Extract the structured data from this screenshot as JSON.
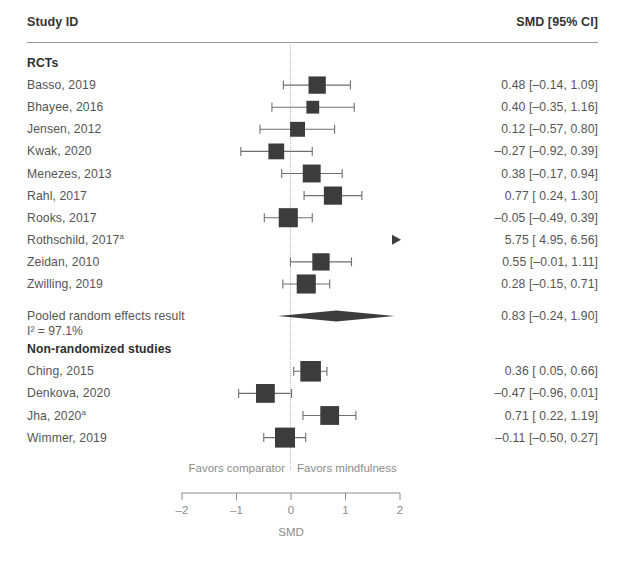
{
  "header": {
    "study_column": "Study ID",
    "estimate_column": "SMD [95% CI]"
  },
  "groups": [
    {
      "label": "RCTs"
    },
    {
      "label": "Non-randomized studies"
    }
  ],
  "pooled": {
    "label": "Pooled random effects result",
    "heterogeneity": "I² = 97.1%",
    "estimate_text": "0.83 [–0.24, 1.90]"
  },
  "footnote_marker": "a",
  "axis": {
    "title": "SMD",
    "left_hint": "Favors comparator",
    "right_hint": "Favors mindfulness",
    "tick_labels": [
      "–2",
      "–1",
      "0",
      "1",
      "2"
    ],
    "tick_values": [
      -2,
      -1,
      0,
      1,
      2
    ],
    "min": -2,
    "max": 2
  },
  "rows": [
    {
      "study": "Basso, 2019",
      "estimate_text": "0.48 [–0.14, 1.09]"
    },
    {
      "study": "Bhayee, 2016",
      "estimate_text": "0.40 [–0.35, 1.16]"
    },
    {
      "study": "Jensen, 2012",
      "estimate_text": "0.12 [–0.57, 0.80]"
    },
    {
      "study": "Kwak, 2020",
      "estimate_text": "–0.27 [–0.92, 0.39]"
    },
    {
      "study": "Menezes, 2013",
      "estimate_text": "0.38 [–0.17, 0.94]"
    },
    {
      "study": "Rahl, 2017",
      "estimate_text": "0.77 [ 0.24, 1.30]"
    },
    {
      "study": "Rooks, 2017",
      "estimate_text": "–0.05 [–0.49, 0.39]"
    },
    {
      "study": "Rothschild, 2017",
      "estimate_text": "5.75 [ 4.95, 6.56]",
      "superscript": "a"
    },
    {
      "study": "Zeidan, 2010",
      "estimate_text": "0.55 [–0.01, 1.11]"
    },
    {
      "study": "Zwilling, 2019",
      "estimate_text": "0.28 [–0.15, 0.71]"
    },
    {
      "study": "Ching, 2015",
      "estimate_text": "0.36 [ 0.05, 0.66]"
    },
    {
      "study": "Denkova, 2020",
      "estimate_text": "–0.47 [–0.96, 0.01]"
    },
    {
      "study": "Jha, 2020",
      "estimate_text": "0.71 [ 0.22, 1.19]",
      "superscript": "a"
    },
    {
      "study": "Wimmer, 2019",
      "estimate_text": "–0.11 [–0.50, 0.27]"
    }
  ],
  "colors": {
    "marker": "#3c3c3c",
    "line": "#6f6f6f",
    "text": "#555555",
    "rule": "#9a9a9a",
    "zero_line": "#b9b9b9",
    "axis_text": "#8c8c8c"
  },
  "chart_data": {
    "type": "forest",
    "title": "",
    "xlabel": "SMD",
    "ylabel": "",
    "xlim": [
      -2,
      2
    ],
    "xticks": [
      -2,
      -1,
      0,
      1,
      2
    ],
    "grid": false,
    "reference_line": 0,
    "effect_measure": "SMD",
    "ci_level": "95%",
    "left_hint": "Favors comparator",
    "right_hint": "Favors mindfulness",
    "subgroups": [
      {
        "name": "RCTs",
        "studies": [
          {
            "label": "Basso, 2019",
            "est": 0.48,
            "lo": -0.14,
            "hi": 1.09,
            "weight": 0.62
          },
          {
            "label": "Bhayee, 2016",
            "est": 0.4,
            "lo": -0.35,
            "hi": 1.16,
            "weight": 0.32
          },
          {
            "label": "Jensen, 2012",
            "est": 0.12,
            "lo": -0.57,
            "hi": 0.8,
            "weight": 0.46
          },
          {
            "label": "Kwak, 2020",
            "est": -0.27,
            "lo": -0.92,
            "hi": 0.39,
            "weight": 0.52
          },
          {
            "label": "Menezes, 2013",
            "est": 0.38,
            "lo": -0.17,
            "hi": 0.94,
            "weight": 0.66
          },
          {
            "label": "Rahl, 2017",
            "est": 0.77,
            "lo": 0.24,
            "hi": 1.3,
            "weight": 0.68
          },
          {
            "label": "Rooks, 2017",
            "est": -0.05,
            "lo": -0.49,
            "hi": 0.39,
            "weight": 0.74
          },
          {
            "label": "Rothschild, 2017",
            "est": 5.75,
            "lo": 4.95,
            "hi": 6.56,
            "weight": 0.3,
            "offscale": true
          },
          {
            "label": "Zeidan, 2010",
            "est": 0.55,
            "lo": -0.01,
            "hi": 1.11,
            "weight": 0.62
          },
          {
            "label": "Zwilling, 2019",
            "est": 0.28,
            "lo": -0.15,
            "hi": 0.71,
            "weight": 0.74
          }
        ],
        "pooled": {
          "label": "Pooled random effects result",
          "est": 0.83,
          "lo": -0.24,
          "hi": 1.9,
          "i_squared": 97.1
        }
      },
      {
        "name": "Non-randomized studies",
        "studies": [
          {
            "label": "Ching, 2015",
            "est": 0.36,
            "lo": 0.05,
            "hi": 0.66,
            "weight": 0.84
          },
          {
            "label": "Denkova, 2020",
            "est": -0.47,
            "lo": -0.96,
            "hi": 0.01,
            "weight": 0.72
          },
          {
            "label": "Jha, 2020",
            "est": 0.71,
            "lo": 0.22,
            "hi": 1.19,
            "weight": 0.72
          },
          {
            "label": "Wimmer, 2019",
            "est": -0.11,
            "lo": -0.5,
            "hi": 0.27,
            "weight": 0.8
          }
        ]
      }
    ]
  }
}
